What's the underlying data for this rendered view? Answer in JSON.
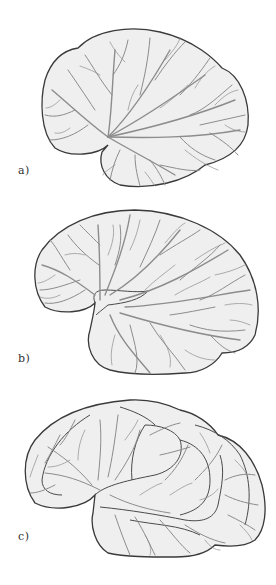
{
  "figure": {
    "panels": [
      {
        "id": "a",
        "label": "a)",
        "description": "Smooth early-stage brain hemisphere with radiating vessels"
      },
      {
        "id": "b",
        "label": "b)",
        "description": "Larger brain hemisphere with emerging lateral fissure and branching vessels"
      },
      {
        "id": "c",
        "label": "c)",
        "description": "Mature folded brain hemisphere with gyri and vessels"
      }
    ]
  },
  "colors": {
    "background": "#ffffff",
    "brain_fill": "#efefef",
    "outline": "#3a3a3a",
    "vessels": "#8c8c8c"
  }
}
